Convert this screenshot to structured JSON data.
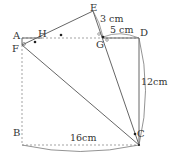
{
  "diagram": {
    "type": "geometry-figure",
    "points": {
      "A": {
        "label": "A",
        "x": 22,
        "y": 38
      },
      "B": {
        "label": "B",
        "x": 22,
        "y": 145
      },
      "C": {
        "label": "C",
        "x": 139,
        "y": 145
      },
      "D": {
        "label": "D",
        "x": 139,
        "y": 37
      },
      "E": {
        "label": "E",
        "x": 93,
        "y": 11
      },
      "F": {
        "label": "F",
        "x": 22,
        "y": 45
      },
      "G": {
        "label": "G",
        "x": 103,
        "y": 37
      },
      "H": {
        "label": "H",
        "x": 42,
        "y": 37
      }
    },
    "measurements": {
      "EG": "3 cm",
      "GD": "5 cm",
      "DC": "12cm",
      "BC": "16cm"
    },
    "colors": {
      "line": "#666666",
      "dashed": "#999999",
      "text": "#333333"
    }
  }
}
